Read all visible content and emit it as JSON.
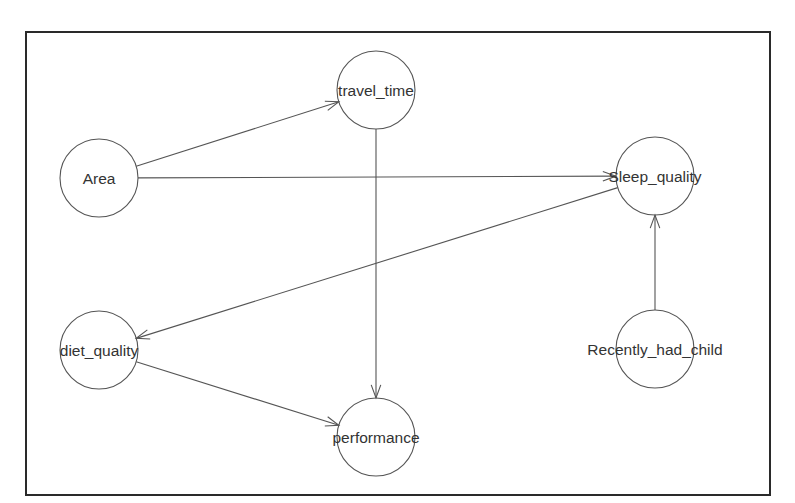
{
  "diagram": {
    "type": "directed-acyclic-graph",
    "nodes": [
      {
        "id": "Area",
        "label": "Area",
        "x": 99,
        "y": 178
      },
      {
        "id": "travel_time",
        "label": "travel_time",
        "x": 376,
        "y": 90
      },
      {
        "id": "Sleep_quality",
        "label": "Sleep_quality",
        "x": 655,
        "y": 176
      },
      {
        "id": "diet_quality",
        "label": "diet_quality",
        "x": 99,
        "y": 350
      },
      {
        "id": "Recently_had_child",
        "label": "Recently_had_child",
        "x": 655,
        "y": 349
      },
      {
        "id": "performance",
        "label": "performance",
        "x": 376,
        "y": 437
      }
    ],
    "edges": [
      {
        "from": "Area",
        "to": "travel_time"
      },
      {
        "from": "Area",
        "to": "Sleep_quality"
      },
      {
        "from": "travel_time",
        "to": "performance"
      },
      {
        "from": "Sleep_quality",
        "to": "diet_quality"
      },
      {
        "from": "Recently_had_child",
        "to": "Sleep_quality"
      },
      {
        "from": "diet_quality",
        "to": "performance"
      }
    ],
    "node_radius": 39
  }
}
